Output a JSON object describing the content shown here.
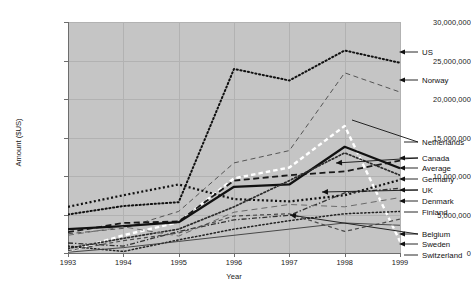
{
  "chart_data": {
    "type": "line",
    "title": "",
    "xlabel": "Year",
    "ylabel": "Amount ($US)",
    "x": [
      1993,
      1994,
      1995,
      1996,
      1997,
      1998,
      1999
    ],
    "categories": [
      "1993",
      "1994",
      "1995",
      "1996",
      "1997",
      "1998",
      "1999"
    ],
    "xlim": [
      1993,
      1999
    ],
    "ylim": [
      0,
      30000000
    ],
    "yticks": [
      0,
      5000000,
      10000000,
      15000000,
      20000000,
      25000000,
      30000000
    ],
    "ytick_labels": [
      "0",
      "5,000,000",
      "10,000,000",
      "15,000,000",
      "20,000,000",
      "25,000,000",
      "30,000,000"
    ],
    "grid": true,
    "legend_position": "right-annotations",
    "series": [
      {
        "name": "US",
        "style": "dotted-thick",
        "color": "#111111",
        "values": [
          5000000,
          6100000,
          6600000,
          23900000,
          22400000,
          26300000,
          24700000
        ]
      },
      {
        "name": "Norway",
        "style": "dashed-thin",
        "color": "#555555",
        "values": [
          2500000,
          3200000,
          5400000,
          11700000,
          13300000,
          23400000,
          20900000
        ]
      },
      {
        "name": "Netherlands",
        "style": "dashed-white",
        "color": "#ffffff",
        "values": [
          200000,
          2300000,
          4000000,
          9700000,
          11100000,
          16500000,
          1500000
        ]
      },
      {
        "name": "Canada",
        "style": "dashed-black",
        "color": "#1a1a1a",
        "values": [
          2700000,
          3900000,
          4100000,
          9400000,
          10100000,
          10600000,
          12000000
        ]
      },
      {
        "name": "Average",
        "style": "solid-thick",
        "color": "#111111",
        "values": [
          3100000,
          3500000,
          4000000,
          8600000,
          8900000,
          13800000,
          11000000
        ]
      },
      {
        "name": "Germany",
        "style": "dotted-med",
        "color": "#2b2b2b",
        "values": [
          600000,
          1900000,
          3100000,
          6000000,
          9400000,
          13000000,
          10100000
        ]
      },
      {
        "name": "UK",
        "style": "dotted-sq",
        "color": "#111111",
        "values": [
          6000000,
          7500000,
          8900000,
          7000000,
          6700000,
          7500000,
          9500000
        ]
      },
      {
        "name": "Denmark",
        "style": "dashdot",
        "color": "#333333",
        "values": [
          1300000,
          900000,
          2800000,
          4300000,
          4900000,
          7800000,
          8400000
        ]
      },
      {
        "name": "Finland",
        "style": "dashed-gray",
        "color": "#6a6a6a",
        "values": [
          2300000,
          3400000,
          2200000,
          5300000,
          6300000,
          6000000,
          7200000
        ]
      },
      {
        "name": "Belgium",
        "style": "dotted-fine",
        "color": "#222222",
        "values": [
          900000,
          200000,
          1700000,
          3100000,
          4200000,
          5100000,
          5400000
        ]
      },
      {
        "name": "Sweden",
        "style": "dashed-med",
        "color": "#4a4a4a",
        "values": [
          300000,
          1600000,
          2600000,
          4800000,
          5100000,
          2800000,
          4400000
        ]
      },
      {
        "name": "Switzerland",
        "style": "solid-thin",
        "color": "#3a3a3a",
        "values": [
          100000,
          700000,
          1500000,
          2300000,
          3100000,
          3900000,
          3600000
        ]
      }
    ],
    "annotations": [
      {
        "label": "US",
        "has_arrow": true,
        "y_px": 52
      },
      {
        "label": "Norway",
        "has_arrow": true,
        "y_px": 80
      },
      {
        "label": "Netherlands",
        "has_arrow": false,
        "y_px": 142
      },
      {
        "label": "Canada",
        "has_arrow": true,
        "y_px": 158
      },
      {
        "label": "Average",
        "has_arrow": true,
        "y_px": 168
      },
      {
        "label": "Germany",
        "has_arrow": true,
        "y_px": 179
      },
      {
        "label": "UK",
        "has_arrow": true,
        "y_px": 190
      },
      {
        "label": "Denmark",
        "has_arrow": true,
        "y_px": 201
      },
      {
        "label": "Finland",
        "has_arrow": false,
        "y_px": 212
      },
      {
        "label": "Belgium",
        "has_arrow": true,
        "y_px": 234
      },
      {
        "label": "Sweden",
        "has_arrow": true,
        "y_px": 244
      },
      {
        "label": "Switzerland",
        "has_arrow": false,
        "y_px": 255
      }
    ]
  }
}
